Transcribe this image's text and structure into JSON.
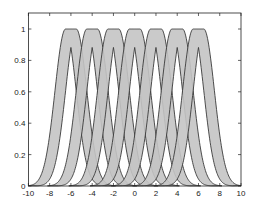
{
  "chart_data": {
    "type": "area",
    "title": "",
    "xlabel": "",
    "ylabel": "",
    "xlim": [
      -10,
      10
    ],
    "ylim": [
      0,
      1.1
    ],
    "grid": false,
    "legend": null,
    "x_ticks": [
      -10,
      -8,
      -6,
      -4,
      -2,
      0,
      2,
      4,
      6,
      8,
      10
    ],
    "y_ticks": [
      0,
      0.2,
      0.4,
      0.6,
      0.8,
      1
    ],
    "x_tick_labels": [
      "-10",
      "-8",
      "-6",
      "-4",
      "-2",
      "0",
      "2",
      "4",
      "6",
      "8",
      "10"
    ],
    "y_tick_labels": [
      "0",
      "0.2",
      "0.4",
      "0.6",
      "0.8",
      "1"
    ],
    "series": [
      {
        "name": "MF1",
        "center": -6,
        "mean_range": [
          -6.5,
          -5.5
        ],
        "sigma": 1.0,
        "upper_peak": 1.0,
        "lower_peak": 0.88
      },
      {
        "name": "MF2",
        "center": -4,
        "mean_range": [
          -4.5,
          -3.5
        ],
        "sigma": 1.0,
        "upper_peak": 1.0,
        "lower_peak": 0.88
      },
      {
        "name": "MF3",
        "center": -2,
        "mean_range": [
          -2.5,
          -1.5
        ],
        "sigma": 1.0,
        "upper_peak": 1.0,
        "lower_peak": 0.88
      },
      {
        "name": "MF4",
        "center": 0,
        "mean_range": [
          -0.5,
          0.5
        ],
        "sigma": 1.0,
        "upper_peak": 1.0,
        "lower_peak": 0.88
      },
      {
        "name": "MF5",
        "center": 2,
        "mean_range": [
          1.5,
          2.5
        ],
        "sigma": 1.0,
        "upper_peak": 1.0,
        "lower_peak": 0.88
      },
      {
        "name": "MF6",
        "center": 4,
        "mean_range": [
          3.5,
          4.5
        ],
        "sigma": 1.0,
        "upper_peak": 1.0,
        "lower_peak": 0.88
      },
      {
        "name": "MF7",
        "center": 6,
        "mean_range": [
          5.5,
          6.5
        ],
        "sigma": 1.0,
        "upper_peak": 1.0,
        "lower_peak": 0.88
      }
    ],
    "colors": {
      "fill": "#c4c4c4",
      "stroke": "#3a3a3a",
      "axis": "#222222"
    }
  }
}
